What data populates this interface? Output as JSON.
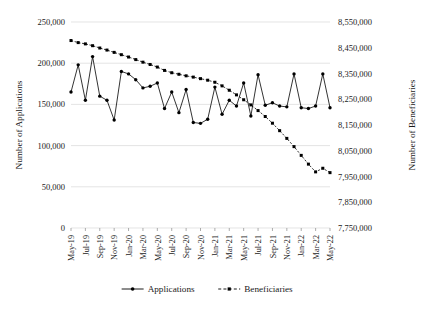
{
  "chart_data": {
    "type": "line",
    "title": "",
    "xlabel": "",
    "ylabel": "Number of Applications",
    "y2label": "Number of Beneficiaries",
    "grid": true,
    "legend_position": "bottom",
    "ylim": [
      0,
      250000
    ],
    "y2lim": [
      7750000,
      8550000
    ],
    "yticks": [
      "0",
      "50,000",
      "100,000",
      "150,000",
      "200,000",
      "250,000"
    ],
    "ytick_values": [
      0,
      50000,
      100000,
      150000,
      200000,
      250000
    ],
    "y2ticks": [
      "7,750,000",
      "7,850,000",
      "7,950,000",
      "8,050,000",
      "8,150,000",
      "8,250,000",
      "8,350,000",
      "8,450,000",
      "8,550,000"
    ],
    "y2tick_values": [
      7750000,
      7850000,
      7950000,
      8050000,
      8150000,
      8250000,
      8350000,
      8450000,
      8550000
    ],
    "x": [
      "May-19",
      "Jun-19",
      "Jul-19",
      "Aug-19",
      "Sep-19",
      "Oct-19",
      "Nov-19",
      "Dec-19",
      "Jan-20",
      "Feb-20",
      "Mar-20",
      "Apr-20",
      "May-20",
      "Jun-20",
      "Jul-20",
      "Aug-20",
      "Sep-20",
      "Oct-20",
      "Nov-20",
      "Dec-20",
      "Jan-21",
      "Feb-21",
      "Mar-21",
      "Apr-21",
      "May-21",
      "Jun-21",
      "Jul-21",
      "Aug-21",
      "Sep-21",
      "Oct-21",
      "Nov-21",
      "Dec-21",
      "Jan-22",
      "Feb-22",
      "Mar-22",
      "Apr-22",
      "May-22"
    ],
    "xtick_labels": [
      "May-19",
      "Jul-19",
      "Sep-19",
      "Nov-19",
      "Jan-20",
      "Mar-20",
      "May-20",
      "Jul-20",
      "Sep-20",
      "Nov-20",
      "Jan-21",
      "Mar-21",
      "May-21",
      "Jul-21",
      "Sep-21",
      "Nov-21",
      "Jan-22",
      "Mar-22",
      "May-22"
    ],
    "xtick_indices": [
      0,
      2,
      4,
      6,
      8,
      10,
      12,
      14,
      16,
      18,
      20,
      22,
      24,
      26,
      28,
      30,
      32,
      34,
      36
    ],
    "series": [
      {
        "name": "Applications",
        "axis": "left",
        "marker": "circle",
        "linestyle": "solid",
        "color": "#000000",
        "values": [
          165000,
          198000,
          155000,
          208000,
          160000,
          155000,
          131000,
          190000,
          187000,
          180000,
          170000,
          172000,
          176000,
          145000,
          165000,
          140000,
          168000,
          128000,
          127000,
          132000,
          171000,
          138000,
          155000,
          148000,
          176000,
          136000,
          186000,
          149000,
          152000,
          148000,
          147000,
          187000,
          146000,
          145000,
          148000,
          187000,
          146000
        ]
      },
      {
        "name": "Beneficiaries",
        "axis": "right",
        "marker": "square",
        "linestyle": "dashed",
        "color": "#000000",
        "values": [
          8478000,
          8470000,
          8465000,
          8458000,
          8449000,
          8441000,
          8432000,
          8423000,
          8414000,
          8404000,
          8394000,
          8385000,
          8375000,
          8362000,
          8353000,
          8347000,
          8341000,
          8336000,
          8330000,
          8324000,
          8316000,
          8302000,
          8285000,
          8267000,
          8248000,
          8228000,
          8206000,
          8183000,
          8157000,
          8128000,
          8098000,
          8066000,
          8032000,
          7998000,
          7968000,
          7982000,
          7965000
        ]
      }
    ],
    "legend": [
      {
        "label": "Applications",
        "marker": "circle",
        "linestyle": "solid"
      },
      {
        "label": "Beneficiaries",
        "marker": "square",
        "linestyle": "dashed"
      }
    ]
  }
}
